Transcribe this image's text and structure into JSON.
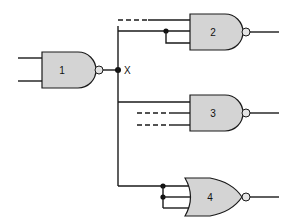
{
  "diagram": {
    "title": "",
    "node_label": "X",
    "gates": [
      {
        "id": "1",
        "label": "1",
        "type": "NAND"
      },
      {
        "id": "2",
        "label": "2",
        "type": "NAND"
      },
      {
        "id": "3",
        "label": "3",
        "type": "NAND"
      },
      {
        "id": "4",
        "label": "4",
        "type": "NOR"
      }
    ],
    "colors": {
      "gate_fill": "#d4d4d4",
      "line": "#1a1a1a",
      "background": "#ffffff"
    }
  }
}
